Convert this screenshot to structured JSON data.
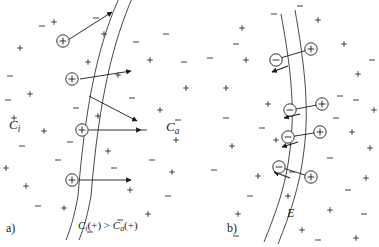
{
  "figure": {
    "background_color": "#ffffff",
    "ink_color": "#1a1a1a",
    "width": 379,
    "height": 247
  },
  "panels": [
    {
      "id": "a",
      "label": "a)",
      "caption": "Ci(+) > Ca(+)",
      "caption_parts": {
        "c_inner": "C",
        "sub_inner": "i",
        "paren_inner": "(+)",
        "relation": ">",
        "c_outer": "C",
        "sub_outer": "a",
        "paren_outer": "(+)"
      },
      "region_labels": [
        {
          "name": "inner-concentration",
          "symbol": "C",
          "subscript": "i"
        },
        {
          "name": "outer-concentration",
          "symbol": "C",
          "subscript": "a"
        }
      ],
      "description": "Circled positive ions crossing the membrane outward, flux arrows point right",
      "carriers": [
        {
          "sign": "+",
          "x": 63,
          "y": 41
        },
        {
          "sign": "+",
          "x": 72,
          "y": 79
        },
        {
          "sign": "+",
          "x": 82,
          "y": 130
        },
        {
          "sign": "+",
          "x": 72,
          "y": 180
        }
      ],
      "arrows": [
        {
          "x1": 70,
          "y1": 38,
          "x2": 112,
          "y2": 12
        },
        {
          "x1": 79,
          "y1": 79,
          "x2": 131,
          "y2": 72
        },
        {
          "x1": 89,
          "y1": 130,
          "x2": 141,
          "y2": 130
        },
        {
          "x1": 79,
          "y1": 180,
          "x2": 131,
          "y2": 180
        },
        {
          "x1": 89,
          "y1": 96,
          "x2": 136,
          "y2": 120
        }
      ]
    },
    {
      "id": "b",
      "label": "b)",
      "field_label": "E",
      "description": "Dipole pairs aligned across the membrane, negative charges outside, positive inside, generating field E",
      "dipoles": [
        {
          "minus_x": 276,
          "minus_y": 60,
          "plus_x": 311,
          "plus_y": 49
        },
        {
          "minus_x": 290,
          "minus_y": 110,
          "plus_x": 322,
          "plus_y": 104
        },
        {
          "minus_x": 288,
          "minus_y": 137,
          "plus_x": 320,
          "plus_y": 132
        },
        {
          "minus_x": 279,
          "minus_y": 167,
          "plus_x": 311,
          "plus_y": 177
        }
      ]
    }
  ],
  "membrane": {
    "stroke_width": 0.8,
    "panel_a_outer": "M 120 -4 C 100 40, 86 96, 78 196 C 74 218, 70 230, 66 240",
    "panel_a_inner": "M 133 -4 C 113 42, 99 98, 91 196 C 87 218, 83 230, 79 240",
    "panel_b_outer": "M 281 16 C 289 58, 296 104, 290 150 C 286 186, 276 212, 264 240",
    "panel_b_inner": "M 295 12 C 303 56, 310 104, 304 150 C 300 186, 290 214, 278 242"
  },
  "background_charges": {
    "note": "scattered small + and - ion marks in the bulk solution",
    "plus": [
      [
        20,
        48
      ],
      [
        54,
        22
      ],
      [
        118,
        75
      ],
      [
        150,
        60
      ],
      [
        30,
        94
      ],
      [
        98,
        116
      ],
      [
        160,
        110
      ],
      [
        44,
        131
      ],
      [
        108,
        151
      ],
      [
        186,
        88
      ],
      [
        6,
        168
      ],
      [
        130,
        190
      ],
      [
        172,
        172
      ],
      [
        64,
        208
      ],
      [
        148,
        214
      ],
      [
        26,
        186
      ],
      [
        88,
        62
      ],
      [
        14,
        118
      ],
      [
        176,
        140
      ],
      [
        104,
        34
      ],
      [
        246,
        60
      ],
      [
        318,
        20
      ],
      [
        358,
        74
      ],
      [
        268,
        104
      ],
      [
        352,
        132
      ],
      [
        288,
        196
      ],
      [
        366,
        178
      ],
      [
        232,
        146
      ],
      [
        344,
        44
      ],
      [
        258,
        176
      ],
      [
        374,
        110
      ],
      [
        226,
        88
      ],
      [
        302,
        230
      ],
      [
        238,
        214
      ],
      [
        330,
        210
      ],
      [
        276,
        140
      ],
      [
        356,
        238
      ],
      [
        242,
        28
      ],
      [
        370,
        148
      ]
    ],
    "minus": [
      [
        42,
        26
      ],
      [
        96,
        18
      ],
      [
        132,
        98
      ],
      [
        166,
        34
      ],
      [
        10,
        76
      ],
      [
        76,
        108
      ],
      [
        144,
        130
      ],
      [
        22,
        146
      ],
      [
        114,
        168
      ],
      [
        178,
        120
      ],
      [
        58,
        160
      ],
      [
        136,
        42
      ],
      [
        90,
        232
      ],
      [
        168,
        196
      ],
      [
        38,
        206
      ],
      [
        120,
        220
      ],
      [
        8,
        100
      ],
      [
        152,
        160
      ],
      [
        70,
        142
      ],
      [
        184,
        62
      ],
      [
        236,
        44
      ],
      [
        300,
        6
      ],
      [
        340,
        96
      ],
      [
        262,
        128
      ],
      [
        356,
        100
      ],
      [
        226,
        118
      ],
      [
        330,
        158
      ],
      [
        250,
        196
      ],
      [
        372,
        60
      ],
      [
        292,
        172
      ],
      [
        236,
        236
      ],
      [
        318,
        240
      ],
      [
        214,
        170
      ],
      [
        348,
        190
      ],
      [
        274,
        14
      ],
      [
        364,
        214
      ],
      [
        210,
        58
      ],
      [
        336,
        118
      ]
    ]
  }
}
